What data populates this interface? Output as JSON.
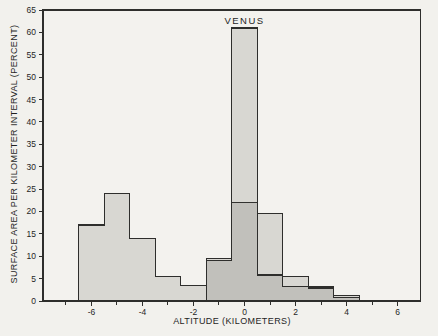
{
  "chart_data": {
    "type": "bar",
    "subtype": "overlapping-step-histograms",
    "title": "",
    "annotation": {
      "text": "VENUS",
      "x": 0,
      "y": 62
    },
    "xlabel": "ALTITUDE (KILOMETERS)",
    "ylabel": "SURFACE AREA PER KILOMETER INTERVAL (PERCENT)",
    "xlim": [
      -7.9,
      6.9
    ],
    "ylim": [
      0,
      65
    ],
    "grid": false,
    "bin_width": 1,
    "x_major_ticks": [
      -6,
      -4,
      -2,
      0,
      2,
      4,
      6
    ],
    "x_tick_labels": [
      "-6",
      "-4",
      "-2",
      "0",
      "2",
      "4",
      "6"
    ],
    "x_minor_ticks": [
      -7,
      -6,
      -5,
      -4,
      -3,
      -2,
      -1,
      0,
      1,
      2,
      3,
      4,
      5,
      6
    ],
    "y_ticks": [
      0,
      5,
      10,
      15,
      20,
      25,
      30,
      35,
      40,
      45,
      50,
      55,
      60,
      65
    ],
    "series": [
      {
        "id": "unlabeled-bimodal",
        "label": "",
        "bin_start": -6.5,
        "bins": [
          [
            -6.5,
            -5.5
          ],
          [
            -5.5,
            -4.5
          ],
          [
            -4.5,
            -3.5
          ],
          [
            -3.5,
            -2.5
          ],
          [
            -2.5,
            -1.5
          ],
          [
            -1.5,
            -0.5
          ],
          [
            -0.5,
            0.5
          ],
          [
            0.5,
            1.5
          ],
          [
            1.5,
            2.5
          ],
          [
            2.5,
            3.5
          ],
          [
            3.5,
            4.5
          ]
        ],
        "values": [
          17,
          24,
          14,
          5.5,
          3.5,
          9.5,
          22,
          19.5,
          5.5,
          3.2,
          1.2
        ]
      },
      {
        "id": "venus",
        "label": "VENUS",
        "bin_start": -1.5,
        "bins": [
          [
            -1.5,
            -0.5
          ],
          [
            -0.5,
            0.5
          ],
          [
            0.5,
            1.5
          ],
          [
            1.5,
            2.5
          ],
          [
            2.5,
            3.5
          ],
          [
            3.5,
            4.5
          ]
        ],
        "values": [
          9,
          61,
          5.8,
          3.2,
          2.9,
          0.8
        ]
      }
    ],
    "style": {
      "background": "#f2f1ed",
      "plot_background": "#f3f2ee",
      "bar_fill": "rgba(75, 75, 68, 0.16)",
      "stroke": "#2e2e2c",
      "frame_stroke": "#2e2e2c",
      "text_color": "#1f1f1f"
    }
  }
}
